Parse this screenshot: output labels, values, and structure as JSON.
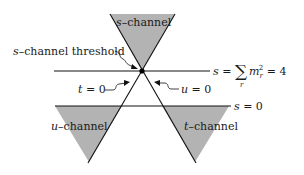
{
  "diagram": {
    "colors": {
      "region_fill": "#b3b3b3",
      "line": "#111111",
      "background": "#ffffff"
    },
    "regions": [
      {
        "id": "s-channel",
        "var": "s",
        "suffix": "–channel"
      },
      {
        "id": "u-channel",
        "var": "u",
        "suffix": "–channel"
      },
      {
        "id": "t-channel",
        "var": "t",
        "suffix": "–channel"
      }
    ],
    "annotations": {
      "threshold": {
        "var": "s",
        "text": "–channel threshold"
      },
      "t_zero": {
        "var": "t",
        "eq": " = 0"
      },
      "u_zero": {
        "var": "u",
        "eq": " = 0"
      },
      "s_threshold_line": {
        "var": "s",
        "eq": " = ",
        "sum": "∑",
        "sum_index": "r",
        "term": "m",
        "sub": "r",
        "sup": "2",
        "tail": " = 4"
      },
      "s_zero_line": {
        "var": "s",
        "eq": " = 0"
      }
    }
  }
}
